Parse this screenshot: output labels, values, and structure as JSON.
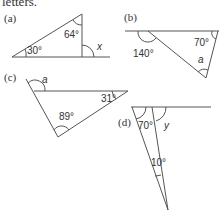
{
  "header": {
    "text": "letters."
  },
  "figures": {
    "a": {
      "label": "(a)",
      "angles": [
        "64°",
        "30°"
      ],
      "unknown": "x"
    },
    "b": {
      "label": "(b)",
      "angles": [
        "140°",
        "70°"
      ],
      "unknown": "a"
    },
    "c": {
      "label": "(c)",
      "angles": [
        "31°",
        "89°"
      ],
      "unknown": "a"
    },
    "d": {
      "label": "(d)",
      "angles": [
        "70°",
        "10°"
      ],
      "unknown": "y"
    }
  },
  "colors": {
    "line": "#555555",
    "text": "#333333"
  }
}
